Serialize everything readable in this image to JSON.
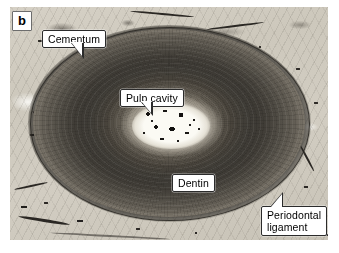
{
  "figure": {
    "panel_letter": "b",
    "alt_description": "Histological cross-section micrograph of a tooth root showing concentric dentin, central pulp cavity, outer cementum and surrounding periodontal ligament",
    "background_color": "#ffffff"
  },
  "micrograph": {
    "plate_background": "#cfcabf",
    "dentin_color": "#4e4a43",
    "pulp_color": "#fbfaf4",
    "matrix_color": "#d2cdc2",
    "cementum_outline_color": "#262321"
  },
  "labels": [
    {
      "id": "cementum",
      "text": "Cementum",
      "pointer": "down-right"
    },
    {
      "id": "pulp-cavity",
      "text": "Pulp cavity",
      "pointer": "down-right"
    },
    {
      "id": "dentin",
      "text": "Dentin",
      "pointer": "none"
    },
    {
      "id": "periodontal-ligament",
      "text": "Periodontal\nligament",
      "pointer": "up-left"
    }
  ],
  "style": {
    "label_box_fill": "#ffffff",
    "label_box_border": "#2b2b2b",
    "label_text_color": "#000000"
  }
}
